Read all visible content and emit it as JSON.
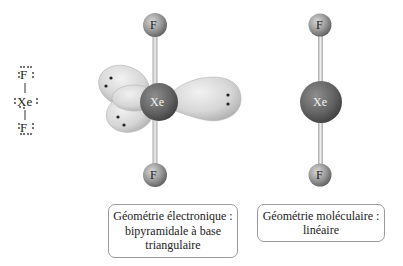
{
  "lewis_structure": {
    "top_atom": "F",
    "center_atom": "Xe",
    "bottom_atom": "F"
  },
  "electron_geometry_model": {
    "top_atom": "F",
    "center_atom": "Xe",
    "bottom_atom": "F",
    "lone_pairs": 3
  },
  "molecular_geometry_model": {
    "top_atom": "F",
    "center_atom": "Xe",
    "bottom_atom": "F"
  },
  "labels": {
    "electron_geometry": {
      "line1": "Géométrie électronique :",
      "line2": "bipyramidale à base",
      "line3": "triangulaire"
    },
    "molecular_geometry": {
      "line1": "Géométrie moléculaire :",
      "line2": "linéaire"
    }
  },
  "colors": {
    "xe_atom": "#6b6b6b",
    "f_atom": "#8c8c8c",
    "lobe": "#d9d9d9",
    "bond": "#c8c8c8",
    "box_border": "#9a9a9a"
  }
}
